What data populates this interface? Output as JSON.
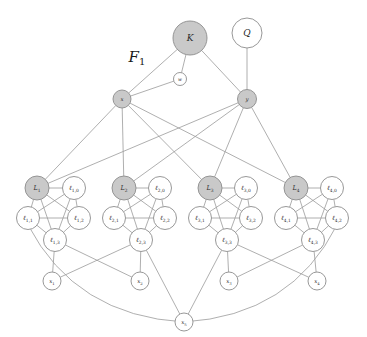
{
  "figure": {
    "caption": "F1",
    "caption_base": "F",
    "caption_sub": "1",
    "width": 367,
    "height": 337,
    "background": "#ffffff",
    "edge_color": "#9a9a9a",
    "node_stroke": "#8c8c8c",
    "fill_gray": "#c9c9c9",
    "fill_white": "#ffffff"
  },
  "chart_data": {
    "type": "diagram",
    "title": "F1",
    "subtype": "undirected-graph",
    "nodes": [
      {
        "id": "K",
        "label": "K",
        "x": 190,
        "y": 38,
        "r": 17,
        "fill": "gray",
        "size": "big"
      },
      {
        "id": "Q",
        "label": "Q",
        "x": 247,
        "y": 33,
        "r": 15,
        "fill": "white",
        "size": "big"
      },
      {
        "id": "w",
        "label": "w",
        "x": 180,
        "y": 79,
        "r": 6.5,
        "fill": "white",
        "size": "tiny"
      },
      {
        "id": "x",
        "label": "x",
        "x": 122,
        "y": 99,
        "r": 9,
        "fill": "gray",
        "size": "small"
      },
      {
        "id": "y",
        "label": "y",
        "x": 247,
        "y": 99,
        "r": 9.5,
        "fill": "gray",
        "size": "small"
      },
      {
        "id": "L1",
        "label": "L1",
        "x": 37,
        "y": 188,
        "r": 12,
        "fill": "gray",
        "size": "med"
      },
      {
        "id": "l1_0",
        "label": "l1,0",
        "x": 74,
        "y": 188,
        "r": 11.5,
        "fill": "white",
        "size": "med"
      },
      {
        "id": "l1_1",
        "label": "l1,1",
        "x": 28,
        "y": 218,
        "r": 11.5,
        "fill": "white",
        "size": "med"
      },
      {
        "id": "l1_2",
        "label": "l1,2",
        "x": 79,
        "y": 218,
        "r": 11.5,
        "fill": "white",
        "size": "med"
      },
      {
        "id": "l1_3",
        "label": "l1,3",
        "x": 55,
        "y": 240,
        "r": 11.5,
        "fill": "white",
        "size": "med"
      },
      {
        "id": "L2",
        "label": "L2",
        "x": 124,
        "y": 188,
        "r": 12,
        "fill": "gray",
        "size": "med"
      },
      {
        "id": "l2_0",
        "label": "l2,0",
        "x": 160,
        "y": 188,
        "r": 11.5,
        "fill": "white",
        "size": "med"
      },
      {
        "id": "l2_1",
        "label": "l2,1",
        "x": 114,
        "y": 218,
        "r": 11.5,
        "fill": "white",
        "size": "med"
      },
      {
        "id": "l2_2",
        "label": "l2,2",
        "x": 165,
        "y": 218,
        "r": 11.5,
        "fill": "white",
        "size": "med"
      },
      {
        "id": "l2_3",
        "label": "l2,3",
        "x": 141,
        "y": 240,
        "r": 11.5,
        "fill": "white",
        "size": "med"
      },
      {
        "id": "L3",
        "label": "L3",
        "x": 210,
        "y": 188,
        "r": 12,
        "fill": "gray",
        "size": "med"
      },
      {
        "id": "l3_0",
        "label": "l3,0",
        "x": 246,
        "y": 188,
        "r": 11.5,
        "fill": "white",
        "size": "med"
      },
      {
        "id": "l3_1",
        "label": "l3,1",
        "x": 200,
        "y": 218,
        "r": 11.5,
        "fill": "white",
        "size": "med"
      },
      {
        "id": "l3_2",
        "label": "l3,2",
        "x": 251,
        "y": 218,
        "r": 11.5,
        "fill": "white",
        "size": "med"
      },
      {
        "id": "l3_3",
        "label": "l3,3",
        "x": 227,
        "y": 240,
        "r": 11.5,
        "fill": "white",
        "size": "med"
      },
      {
        "id": "L4",
        "label": "L4",
        "x": 296,
        "y": 188,
        "r": 12,
        "fill": "gray",
        "size": "med"
      },
      {
        "id": "l4_0",
        "label": "l4,0",
        "x": 332,
        "y": 188,
        "r": 11.5,
        "fill": "white",
        "size": "med"
      },
      {
        "id": "l4_1",
        "label": "l4,1",
        "x": 286,
        "y": 218,
        "r": 11.5,
        "fill": "white",
        "size": "med"
      },
      {
        "id": "l4_2",
        "label": "l4,2",
        "x": 337,
        "y": 218,
        "r": 11.5,
        "fill": "white",
        "size": "med"
      },
      {
        "id": "l4_3",
        "label": "l4,3",
        "x": 313,
        "y": 240,
        "r": 11.5,
        "fill": "white",
        "size": "med"
      },
      {
        "id": "x1",
        "label": "x1",
        "x": 52,
        "y": 281,
        "r": 9,
        "fill": "white",
        "size": "small"
      },
      {
        "id": "x2",
        "label": "x2",
        "x": 140,
        "y": 281,
        "r": 9,
        "fill": "white",
        "size": "small"
      },
      {
        "id": "x3",
        "label": "x3",
        "x": 229,
        "y": 281,
        "r": 9,
        "fill": "white",
        "size": "small"
      },
      {
        "id": "x4",
        "label": "x4",
        "x": 317,
        "y": 281,
        "r": 9,
        "fill": "white",
        "size": "small"
      },
      {
        "id": "x5",
        "label": "x5",
        "x": 184,
        "y": 322,
        "r": 9,
        "fill": "white",
        "size": "small"
      }
    ],
    "node_sub_labels": {
      "K": {
        "base": "K",
        "sub": ""
      },
      "Q": {
        "base": "Q",
        "sub": ""
      },
      "w": {
        "base": "w",
        "sub": ""
      },
      "x": {
        "base": "x",
        "sub": ""
      },
      "y": {
        "base": "y",
        "sub": ""
      },
      "L1": {
        "base": "L",
        "sub": "1"
      },
      "L2": {
        "base": "L",
        "sub": "2"
      },
      "L3": {
        "base": "L",
        "sub": "3"
      },
      "L4": {
        "base": "L",
        "sub": "4"
      },
      "l1_0": {
        "base": "ℓ",
        "sub": "1,0"
      },
      "l1_1": {
        "base": "ℓ",
        "sub": "1,1"
      },
      "l1_2": {
        "base": "ℓ",
        "sub": "1,2"
      },
      "l1_3": {
        "base": "ℓ",
        "sub": "1,3"
      },
      "l2_0": {
        "base": "ℓ",
        "sub": "2,0"
      },
      "l2_1": {
        "base": "ℓ",
        "sub": "2,1"
      },
      "l2_2": {
        "base": "ℓ",
        "sub": "2,2"
      },
      "l2_3": {
        "base": "ℓ",
        "sub": "2,3"
      },
      "l3_0": {
        "base": "ℓ",
        "sub": "3,0"
      },
      "l3_1": {
        "base": "ℓ",
        "sub": "3,1"
      },
      "l3_2": {
        "base": "ℓ",
        "sub": "3,2"
      },
      "l3_3": {
        "base": "ℓ",
        "sub": "3,3"
      },
      "l4_0": {
        "base": "ℓ",
        "sub": "4,0"
      },
      "l4_1": {
        "base": "ℓ",
        "sub": "4,1"
      },
      "l4_2": {
        "base": "ℓ",
        "sub": "4,2"
      },
      "l4_3": {
        "base": "ℓ",
        "sub": "4,3"
      },
      "x1": {
        "base": "x",
        "sub": "1"
      },
      "x2": {
        "base": "x",
        "sub": "2"
      },
      "x3": {
        "base": "x",
        "sub": "3"
      },
      "x4": {
        "base": "x",
        "sub": "4"
      },
      "x5": {
        "base": "x",
        "sub": "5"
      }
    },
    "edges": [
      [
        "K",
        "x"
      ],
      [
        "K",
        "w"
      ],
      [
        "K",
        "y"
      ],
      [
        "Q",
        "y"
      ],
      [
        "x",
        "w"
      ],
      [
        "x",
        "L1"
      ],
      [
        "x",
        "L2"
      ],
      [
        "x",
        "L3"
      ],
      [
        "x",
        "L4"
      ],
      [
        "y",
        "L1"
      ],
      [
        "y",
        "L2"
      ],
      [
        "y",
        "L3"
      ],
      [
        "y",
        "L4"
      ],
      [
        "L1",
        "l1_0"
      ],
      [
        "L1",
        "l1_1"
      ],
      [
        "L1",
        "l1_2"
      ],
      [
        "L1",
        "l1_3"
      ],
      [
        "l1_0",
        "l1_1"
      ],
      [
        "l1_0",
        "l1_2"
      ],
      [
        "l1_0",
        "l1_3"
      ],
      [
        "l1_1",
        "l1_2"
      ],
      [
        "l1_1",
        "l1_3"
      ],
      [
        "l1_2",
        "l1_3"
      ],
      [
        "L2",
        "l2_0"
      ],
      [
        "L2",
        "l2_1"
      ],
      [
        "L2",
        "l2_2"
      ],
      [
        "L2",
        "l2_3"
      ],
      [
        "l2_0",
        "l2_1"
      ],
      [
        "l2_0",
        "l2_2"
      ],
      [
        "l2_0",
        "l2_3"
      ],
      [
        "l2_1",
        "l2_2"
      ],
      [
        "l2_1",
        "l2_3"
      ],
      [
        "l2_2",
        "l2_3"
      ],
      [
        "L3",
        "l3_0"
      ],
      [
        "L3",
        "l3_1"
      ],
      [
        "L3",
        "l3_2"
      ],
      [
        "L3",
        "l3_3"
      ],
      [
        "l3_0",
        "l3_1"
      ],
      [
        "l3_0",
        "l3_2"
      ],
      [
        "l3_0",
        "l3_3"
      ],
      [
        "l3_1",
        "l3_2"
      ],
      [
        "l3_1",
        "l3_3"
      ],
      [
        "l3_2",
        "l3_3"
      ],
      [
        "L4",
        "l4_0"
      ],
      [
        "L4",
        "l4_1"
      ],
      [
        "L4",
        "l4_2"
      ],
      [
        "L4",
        "l4_3"
      ],
      [
        "l4_0",
        "l4_1"
      ],
      [
        "l4_0",
        "l4_2"
      ],
      [
        "l4_0",
        "l4_3"
      ],
      [
        "l4_1",
        "l4_2"
      ],
      [
        "l4_1",
        "l4_3"
      ],
      [
        "l4_2",
        "l4_3"
      ],
      [
        "l1_3",
        "x1"
      ],
      [
        "l1_3",
        "x2"
      ],
      [
        "l2_3",
        "x1"
      ],
      [
        "l2_3",
        "x2"
      ],
      [
        "l3_3",
        "x3"
      ],
      [
        "l3_3",
        "x4"
      ],
      [
        "l4_3",
        "x3"
      ],
      [
        "l4_3",
        "x4"
      ],
      [
        "l2_3",
        "x5"
      ],
      [
        "l3_3",
        "x5"
      ]
    ],
    "curved_edges": [
      {
        "from": "l1_1",
        "to": "x5",
        "bow": 55
      },
      {
        "from": "l4_2",
        "to": "x5",
        "bow": -55
      }
    ],
    "legend": [],
    "grid": false
  }
}
